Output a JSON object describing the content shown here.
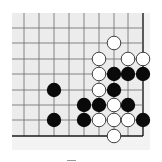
{
  "diagram": {
    "type": "go-board-fragment",
    "colors": {
      "board_bg": "#ececec",
      "margin_bg": "#f3f3f3",
      "grid_line": "#6a6a6a",
      "edge_line": "#1a1a1a",
      "black_stone": "#0a0a0a",
      "white_stone": "#ffffff",
      "white_stroke": "#2a2a2a"
    },
    "grid": {
      "columns_x": [
        24,
        39,
        54,
        69,
        84,
        99,
        114,
        128,
        143
      ],
      "rows_y": [
        28,
        43,
        59,
        74,
        90,
        105,
        120,
        136
      ],
      "board_left": 12,
      "board_top": 13,
      "right_edge_col": 8,
      "bottom_edge_row": 7
    },
    "stones": [
      {
        "color": "white",
        "col": 6,
        "row": 1
      },
      {
        "color": "white",
        "col": 5,
        "row": 2
      },
      {
        "color": "white",
        "col": 7,
        "row": 2
      },
      {
        "color": "white",
        "col": 8,
        "row": 2
      },
      {
        "color": "white",
        "col": 5,
        "row": 3
      },
      {
        "color": "black",
        "col": 6,
        "row": 3
      },
      {
        "color": "black",
        "col": 7,
        "row": 3
      },
      {
        "color": "black",
        "col": 8,
        "row": 3
      },
      {
        "color": "black",
        "col": 2,
        "row": 4
      },
      {
        "color": "white",
        "col": 5,
        "row": 4
      },
      {
        "color": "black",
        "col": 6,
        "row": 4
      },
      {
        "color": "black",
        "col": 4,
        "row": 5
      },
      {
        "color": "black",
        "col": 5,
        "row": 5
      },
      {
        "color": "white",
        "col": 6,
        "row": 5
      },
      {
        "color": "black",
        "col": 7,
        "row": 5
      },
      {
        "color": "black",
        "col": 2,
        "row": 6
      },
      {
        "color": "black",
        "col": 4,
        "row": 6
      },
      {
        "color": "white",
        "col": 5,
        "row": 6
      },
      {
        "color": "white",
        "col": 6,
        "row": 6
      },
      {
        "color": "white",
        "col": 7,
        "row": 6
      },
      {
        "color": "black",
        "col": 8,
        "row": 6
      },
      {
        "color": "white",
        "col": 6,
        "row": 7
      }
    ],
    "stone_radius": 7.2
  }
}
